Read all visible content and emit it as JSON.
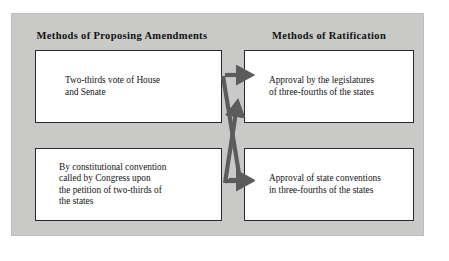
{
  "figure": {
    "panel_background": "#c9c9c7",
    "box_background": "#ffffff",
    "box_border_color": "#2a2a2a",
    "arrow_color": "#5c5c5c",
    "text_color": "#141414"
  },
  "headings": {
    "left": "Methods of Proposing Amendments",
    "right": "Methods of Ratification"
  },
  "boxes": {
    "propose_congress": "Two-thirds vote of House\nand Senate",
    "propose_convention": "By constitutional convention\ncalled by Congress upon\nthe petition of two-thirds of\nthe states",
    "ratify_legislatures": "Approval by the legislatures\nof three-fourths of the states",
    "ratify_conventions": "Approval of state conventions\nin three-fourths of the states"
  },
  "arrows": [
    {
      "name": "congress-to-legislatures",
      "from": "propose_congress",
      "to": "ratify_legislatures",
      "shape": "straight"
    },
    {
      "name": "congress-to-conventions",
      "from": "propose_congress",
      "to": "ratify_conventions",
      "shape": "diagonal-down"
    },
    {
      "name": "convention-to-legislatures",
      "from": "propose_convention",
      "to": "ratify_legislatures",
      "shape": "diagonal-up"
    },
    {
      "name": "convention-to-conventions",
      "from": "propose_convention",
      "to": "ratify_conventions",
      "shape": "straight"
    }
  ]
}
